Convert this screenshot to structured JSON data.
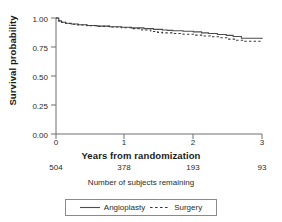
{
  "chart_data": {
    "type": "line",
    "title": "",
    "subtitle": "",
    "xlabel": "Years from randomization",
    "ylabel": "Survival probability",
    "xlim": [
      0,
      3
    ],
    "ylim": [
      0,
      1
    ],
    "xticks": [
      "0",
      "1",
      "2",
      "3"
    ],
    "xtick_values": [
      0,
      1,
      2,
      3
    ],
    "yticks": [
      "0.00",
      "0.25",
      "0.50",
      "0.75",
      "1.00"
    ],
    "ytick_values": [
      0.0,
      0.25,
      0.5,
      0.75,
      1.0
    ],
    "grid": false,
    "legend_position": "bottom",
    "series": [
      {
        "name": "Angioplasty",
        "style": "solid",
        "color": "#4d4d4d",
        "x": [
          0.0,
          0.04,
          0.08,
          0.14,
          0.22,
          0.32,
          0.45,
          0.6,
          0.78,
          0.95,
          1.1,
          1.28,
          1.42,
          1.55,
          1.62,
          1.7,
          1.85,
          2.0,
          2.12,
          2.22,
          2.35,
          2.48,
          2.58,
          2.7,
          3.0
        ],
        "y": [
          1.0,
          0.975,
          0.963,
          0.955,
          0.948,
          0.942,
          0.935,
          0.93,
          0.925,
          0.92,
          0.915,
          0.908,
          0.902,
          0.897,
          0.893,
          0.89,
          0.886,
          0.88,
          0.872,
          0.866,
          0.858,
          0.85,
          0.84,
          0.825,
          0.82
        ]
      },
      {
        "name": "Surgery",
        "style": "dashed",
        "color": "#3a3a3a",
        "x": [
          0.0,
          0.04,
          0.08,
          0.14,
          0.22,
          0.32,
          0.45,
          0.6,
          0.78,
          0.95,
          1.1,
          1.25,
          1.38,
          1.48,
          1.55,
          1.7,
          1.85,
          2.0,
          2.12,
          2.25,
          2.38,
          2.5,
          2.62,
          2.75,
          3.0
        ],
        "y": [
          1.0,
          0.975,
          0.962,
          0.953,
          0.946,
          0.94,
          0.933,
          0.928,
          0.922,
          0.916,
          0.908,
          0.896,
          0.884,
          0.876,
          0.872,
          0.866,
          0.86,
          0.852,
          0.845,
          0.838,
          0.83,
          0.818,
          0.808,
          0.8,
          0.798
        ]
      }
    ],
    "risk_table": {
      "caption": "Number of subjects remaining",
      "x": [
        0,
        1,
        2,
        3
      ],
      "counts": [
        "504",
        "378",
        "193",
        "93"
      ]
    }
  },
  "legend": {
    "items": [
      {
        "label": "Angioplasty",
        "style": "solid"
      },
      {
        "label": "Surgery",
        "style": "dashed"
      }
    ]
  }
}
